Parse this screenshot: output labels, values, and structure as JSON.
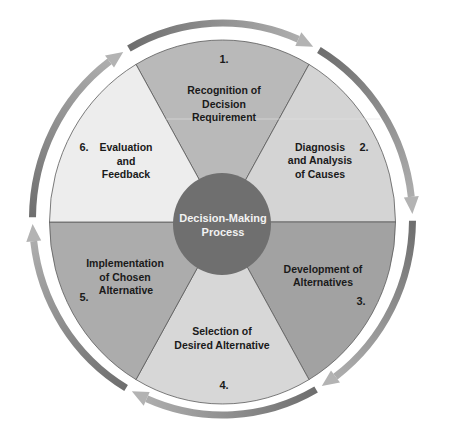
{
  "diagram": {
    "center": {
      "line1": "Decision-Making",
      "line2": "Process"
    },
    "steps": [
      {
        "number": "1.",
        "lines": [
          "Recognition of",
          "Decision",
          "Requirement"
        ]
      },
      {
        "number": "2.",
        "lines": [
          "Diagnosis",
          "and Analysis",
          "of Causes"
        ]
      },
      {
        "number": "3.",
        "lines": [
          "Development of",
          "Alternatives"
        ]
      },
      {
        "number": "4.",
        "lines": [
          "Selection of",
          "Desired Alternative"
        ]
      },
      {
        "number": "5.",
        "lines": [
          "Implementation",
          "of Chosen",
          "Alternative"
        ]
      },
      {
        "number": "6.",
        "lines": [
          "Evaluation",
          "and",
          "Feedback"
        ]
      }
    ],
    "cycle_direction": "clockwise",
    "colors": {
      "step1_fill": "#b9b9b9",
      "step2_fill": "#d4d4d4",
      "step3_fill": "#a2a2a2",
      "step4_fill": "#d7d7d7",
      "step5_fill": "#acacac",
      "step6_fill": "#ededed",
      "center_fill": "#6f6f6f",
      "arrow_tail": "#6e6e6e",
      "arrow_head": "#b3b3b3"
    }
  }
}
